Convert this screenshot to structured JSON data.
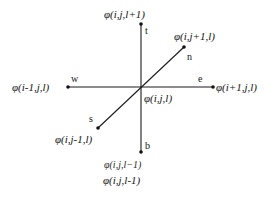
{
  "figure": {
    "background_color": "#ffffff",
    "line_color": "#1a1a1a",
    "text_color": "#141414"
  },
  "nodes": {
    "center": {
      "value_label": "φ(i,j,l)",
      "direction_label": "",
      "x": 141,
      "y": 87
    },
    "top": {
      "value_label": "φ(i,j,l+1)",
      "direction_label": "t",
      "x": 141,
      "y": 24
    },
    "bottom": {
      "value_label": "φ(i,j,l-1)",
      "direction_label": "b",
      "x": 141,
      "y": 152
    },
    "west": {
      "value_label": "φ(i-1,j,l)",
      "direction_label": "w",
      "x": 68,
      "y": 87
    },
    "east": {
      "value_label": "φ(i+1,j,l)",
      "direction_label": "e",
      "x": 213,
      "y": 87
    },
    "north": {
      "value_label": "φ(i,j+1,l)",
      "direction_label": "n",
      "x": 184,
      "y": 47
    },
    "south": {
      "value_label": "φ(i,j-1,l)",
      "direction_label": "s",
      "x": 98,
      "y": 128
    }
  },
  "extra_labels": {
    "bottom_duplicate": "φ(i,j,l−1)"
  },
  "axes": [
    {
      "name": "vertical-axis",
      "x1": 141,
      "y1": 24,
      "x2": 141,
      "y2": 152
    },
    {
      "name": "horizontal-axis",
      "x1": 68,
      "y1": 87,
      "x2": 213,
      "y2": 87
    },
    {
      "name": "diagonal-axis",
      "x1": 98,
      "y1": 128,
      "x2": 184,
      "y2": 47
    }
  ]
}
